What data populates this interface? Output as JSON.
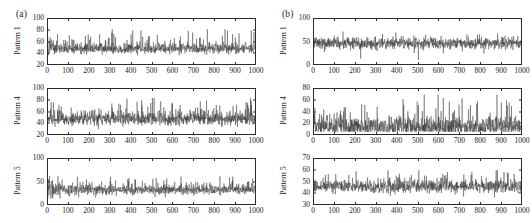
{
  "figure": {
    "background_color": "#ffffff",
    "trace_color": "#262626",
    "axis_color": "#2b2b2b"
  },
  "panels": [
    {
      "tag": "(a)",
      "subplots": [
        {
          "ylabel": "Pattern 1",
          "yticks": [
            "20",
            "40",
            "60",
            "80",
            "100"
          ],
          "xticks": [
            "0",
            "100",
            "200",
            "300",
            "400",
            "500",
            "600",
            "700",
            "800",
            "900",
            "1000"
          ]
        },
        {
          "ylabel": "Pattern 4",
          "yticks": [
            "20",
            "40",
            "60",
            "80",
            "100"
          ],
          "xticks": [
            "0",
            "100",
            "200",
            "300",
            "400",
            "500",
            "600",
            "700",
            "800",
            "900",
            "1000"
          ]
        },
        {
          "ylabel": "Pattern 5",
          "yticks": [
            "0",
            "50",
            "100"
          ],
          "xticks": [
            "0",
            "100",
            "200",
            "300",
            "400",
            "500",
            "600",
            "700",
            "800",
            "900",
            "1000"
          ]
        }
      ]
    },
    {
      "tag": "(b)",
      "subplots": [
        {
          "ylabel": "Pattern 1",
          "yticks": [
            "0",
            "50",
            "100"
          ],
          "xticks": [
            "0",
            "100",
            "200",
            "300",
            "400",
            "500",
            "600",
            "700",
            "800",
            "900",
            "1000"
          ]
        },
        {
          "ylabel": "Pattern 4",
          "yticks": [
            "0",
            "20",
            "40",
            "60",
            "80"
          ],
          "xticks": [
            "0",
            "100",
            "200",
            "300",
            "400",
            "500",
            "600",
            "700",
            "800",
            "900",
            "1000"
          ]
        },
        {
          "ylabel": "Pattern 5",
          "yticks": [
            "30",
            "40",
            "50",
            "60",
            "70"
          ],
          "xticks": [
            "0",
            "100",
            "200",
            "300",
            "400",
            "500",
            "600",
            "700",
            "800",
            "900",
            "1000"
          ]
        }
      ]
    }
  ],
  "chart_data": [
    {
      "type": "line",
      "panel": "(a)",
      "title": "Pattern 1",
      "xlabel": "",
      "ylabel": "Pattern 1",
      "xlim": [
        0,
        1000
      ],
      "ylim": [
        20,
        100
      ],
      "xticks": [
        0,
        100,
        200,
        300,
        400,
        500,
        600,
        700,
        800,
        900,
        1000
      ],
      "yticks": [
        20,
        40,
        60,
        80,
        100
      ],
      "grid": false,
      "legend": null,
      "series": [
        {
          "name": "Pattern 1",
          "n_points": 1000,
          "description": "Dense high-frequency noise trace, nearly stationary across the full record.",
          "mean": 48,
          "std": 5.5,
          "min": 30,
          "max": 82,
          "baseline": 48,
          "envelope_low": 40,
          "envelope_high": 60,
          "notable_spikes": [
            {
              "x": 770,
              "y": 82
            },
            {
              "x": 180,
              "y": 70
            },
            {
              "x": 640,
              "y": 69
            },
            {
              "x": 905,
              "y": 67
            }
          ]
        }
      ]
    },
    {
      "type": "line",
      "panel": "(a)",
      "title": "Pattern 4",
      "xlabel": "",
      "ylabel": "Pattern 4",
      "xlim": [
        0,
        1000
      ],
      "ylim": [
        20,
        100
      ],
      "xticks": [
        0,
        100,
        200,
        300,
        400,
        500,
        600,
        700,
        800,
        900,
        1000
      ],
      "yticks": [
        20,
        40,
        60,
        80,
        100
      ],
      "grid": false,
      "legend": null,
      "series": [
        {
          "name": "Pattern 4",
          "n_points": 1000,
          "description": "Dense noise band slightly wider than Pattern 1, stationary mean with occasional tall excursions.",
          "mean": 48,
          "std": 7.0,
          "min": 28,
          "max": 84,
          "baseline": 48,
          "envelope_low": 38,
          "envelope_high": 62,
          "notable_spikes": [
            {
              "x": 505,
              "y": 84
            },
            {
              "x": 545,
              "y": 78
            },
            {
              "x": 350,
              "y": 72
            },
            {
              "x": 830,
              "y": 71
            }
          ]
        }
      ]
    },
    {
      "type": "line",
      "panel": "(a)",
      "title": "Pattern 5",
      "xlabel": "",
      "ylabel": "Pattern 5",
      "xlim": [
        0,
        1000
      ],
      "ylim": [
        0,
        100
      ],
      "xticks": [
        0,
        100,
        200,
        300,
        400,
        500,
        600,
        700,
        800,
        900,
        1000
      ],
      "yticks": [
        0,
        50,
        100
      ],
      "grid": false,
      "legend": null,
      "series": [
        {
          "name": "Pattern 5",
          "n_points": 1000,
          "description": "Large-amplitude oscillation at the start that decays within the first ~120 samples into a narrow noise band around 30.",
          "mean": 32,
          "std": 7.0,
          "min": 12,
          "max": 62,
          "baseline": 32,
          "envelope_low": 24,
          "envelope_high": 42,
          "initial_amplitude": 30,
          "decay_length": 120,
          "notable_spikes": [
            {
              "x": 8,
              "y": 62
            },
            {
              "x": 300,
              "y": 52
            },
            {
              "x": 455,
              "y": 48
            }
          ]
        }
      ]
    },
    {
      "type": "line",
      "panel": "(b)",
      "title": "Pattern 1",
      "xlabel": "",
      "ylabel": "Pattern 1",
      "xlim": [
        0,
        1000
      ],
      "ylim": [
        0,
        100
      ],
      "xticks": [
        0,
        100,
        200,
        300,
        400,
        500,
        600,
        700,
        800,
        900,
        1000
      ],
      "yticks": [
        0,
        50,
        100
      ],
      "grid": false,
      "legend": null,
      "series": [
        {
          "name": "Pattern 1",
          "n_points": 1000,
          "description": "Dense band centred just below 50 with frequent deep downward spikes toward 10-20.",
          "mean": 45,
          "std": 9.0,
          "min": 8,
          "max": 72,
          "baseline": 46,
          "envelope_low": 36,
          "envelope_high": 56,
          "notable_spikes": [
            {
              "x": 140,
              "y": 72
            },
            {
              "x": 395,
              "y": 70
            },
            {
              "x": 505,
              "y": 9
            },
            {
              "x": 225,
              "y": 12
            }
          ]
        }
      ]
    },
    {
      "type": "line",
      "panel": "(b)",
      "title": "Pattern 4",
      "xlabel": "",
      "ylabel": "Pattern 4",
      "xlim": [
        0,
        1000
      ],
      "ylim": [
        0,
        80
      ],
      "xticks": [
        0,
        100,
        200,
        300,
        400,
        500,
        600,
        700,
        800,
        900,
        1000
      ],
      "yticks": [
        0,
        20,
        40,
        60,
        80
      ],
      "grid": false,
      "legend": null,
      "series": [
        {
          "name": "Pattern 4",
          "n_points": 1000,
          "description": "Spiky intermittent bursts rising from a low baseline near 15 to peaks above 60; many isolated tall impulses.",
          "mean": 20,
          "std": 11.0,
          "min": 4,
          "max": 70,
          "baseline": 15,
          "envelope_low": 8,
          "envelope_high": 34,
          "notable_spikes": [
            {
              "x": 600,
              "y": 70
            },
            {
              "x": 625,
              "y": 64
            },
            {
              "x": 430,
              "y": 62
            },
            {
              "x": 790,
              "y": 58
            },
            {
              "x": 905,
              "y": 56
            }
          ]
        }
      ]
    },
    {
      "type": "line",
      "panel": "(b)",
      "title": "Pattern 5",
      "xlabel": "",
      "ylabel": "Pattern 5",
      "xlim": [
        0,
        1000
      ],
      "ylim": [
        30,
        70
      ],
      "xticks": [
        0,
        100,
        200,
        300,
        400,
        500,
        600,
        700,
        800,
        900,
        1000
      ],
      "yticks": [
        30,
        40,
        50,
        60,
        70
      ],
      "grid": false,
      "legend": null,
      "series": [
        {
          "name": "Pattern 5",
          "n_points": 1000,
          "description": "Tight stationary noise band centred near 46 with a modest widening toward the right-hand end.",
          "mean": 46,
          "std": 3.4,
          "min": 36,
          "max": 60,
          "baseline": 46,
          "envelope_low": 42,
          "envelope_high": 50,
          "notable_spikes": [
            {
              "x": 880,
              "y": 60
            },
            {
              "x": 935,
              "y": 58
            },
            {
              "x": 470,
              "y": 56
            }
          ]
        }
      ]
    }
  ]
}
